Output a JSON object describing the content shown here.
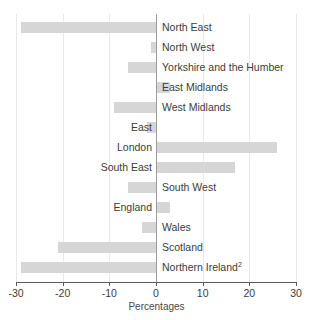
{
  "chart_data": {
    "type": "bar",
    "orientation": "horizontal",
    "title": "",
    "xlabel": "Percentages",
    "ylabel": "",
    "xlim": [
      -30,
      30
    ],
    "xticks": [
      -30,
      -20,
      -10,
      0,
      10,
      20,
      30
    ],
    "xtick_labels": [
      "-30",
      "-20",
      "-10",
      "0",
      "10",
      "20",
      "30"
    ],
    "grid": true,
    "legend": null,
    "bar_color": "#d6d6d6",
    "zero_line_color": "#9b9b9b",
    "categories": [
      "North East",
      "North West",
      "Yorkshire and the Humber",
      "East Midlands",
      "West Midlands",
      "East",
      "London",
      "South East",
      "South West",
      "England",
      "Wales",
      "Scotland",
      "Northern Ireland"
    ],
    "values": [
      -29,
      -1,
      -6,
      3,
      -9,
      -2,
      26,
      17,
      -6,
      3,
      -3,
      -21,
      -29
    ],
    "bars": [
      {
        "label": "North East",
        "value": -29,
        "label_side": "pos",
        "superscript": ""
      },
      {
        "label": "North West",
        "value": -1,
        "label_side": "pos",
        "superscript": ""
      },
      {
        "label": "Yorkshire and the Humber",
        "value": -6,
        "label_side": "pos",
        "superscript": ""
      },
      {
        "label": "East Midlands",
        "value": 3,
        "label_side": "pos",
        "superscript": ""
      },
      {
        "label": "West Midlands",
        "value": -9,
        "label_side": "pos",
        "superscript": ""
      },
      {
        "label": "East",
        "value": -2,
        "label_side": "neg",
        "superscript": ""
      },
      {
        "label": "London",
        "value": 26,
        "label_side": "neg",
        "superscript": ""
      },
      {
        "label": "South East",
        "value": 17,
        "label_side": "neg",
        "superscript": ""
      },
      {
        "label": "South West",
        "value": -6,
        "label_side": "pos",
        "superscript": ""
      },
      {
        "label": "England",
        "value": 3,
        "label_side": "neg",
        "superscript": ""
      },
      {
        "label": "Wales",
        "value": -3,
        "label_side": "pos",
        "superscript": ""
      },
      {
        "label": "Scotland",
        "value": -21,
        "label_side": "pos",
        "superscript": ""
      },
      {
        "label": "Northern Ireland",
        "value": -29,
        "label_side": "pos",
        "superscript": "2"
      }
    ]
  }
}
